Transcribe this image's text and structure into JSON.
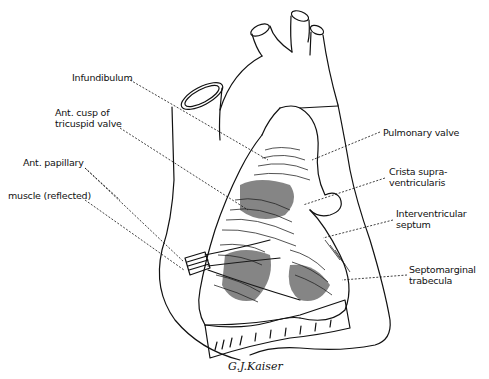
{
  "diagram": {
    "labels": [
      {
        "id": "infundibulum",
        "lines": [
          "Infundibulum"
        ],
        "x": 72,
        "y": 72
      },
      {
        "id": "ant-cusp-tricuspid",
        "lines": [
          "Ant. cusp of",
          "tricuspid valve"
        ],
        "x": 55,
        "y": 107
      },
      {
        "id": "ant-papillary",
        "lines": [
          "Ant. papillary"
        ],
        "x": 23,
        "y": 157
      },
      {
        "id": "muscle-reflected",
        "lines": [
          "muscle (reflected)"
        ],
        "x": 8,
        "y": 190
      },
      {
        "id": "pulmonary-valve",
        "lines": [
          "Pulmonary valve"
        ],
        "x": 383,
        "y": 127
      },
      {
        "id": "crista-supraventricularis",
        "lines": [
          "Crista supra-",
          "ventricularis"
        ],
        "x": 389,
        "y": 166
      },
      {
        "id": "interventricular-septum",
        "lines": [
          "Interventricular",
          "septum"
        ],
        "x": 396,
        "y": 208
      },
      {
        "id": "septomarginal-trabecula",
        "lines": [
          "Septomarginal",
          "trabecula"
        ],
        "x": 409,
        "y": 264
      }
    ],
    "signature": "G.J.Kaiser"
  }
}
